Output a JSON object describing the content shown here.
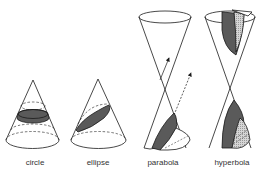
{
  "colors": {
    "stroke": "#1a1a1a",
    "dark_fill": "#5a5a5a",
    "light_fill": "#c8c8c8",
    "background": "#ffffff"
  },
  "sections": [
    {
      "id": "circle",
      "label": "circle",
      "label_x": 35
    },
    {
      "id": "ellipse",
      "label": "ellipse",
      "label_x": 98
    },
    {
      "id": "parabola",
      "label": "parabola",
      "label_x": 163
    },
    {
      "id": "hyperbola",
      "label": "hyperbola",
      "label_x": 232
    }
  ]
}
